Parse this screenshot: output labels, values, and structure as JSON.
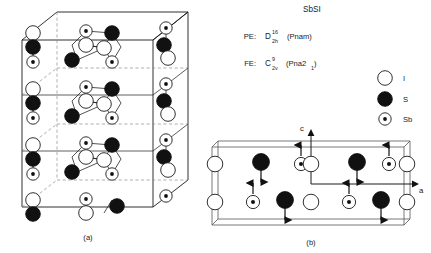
{
  "figure": {
    "compound_title": "SbSI",
    "panel_a_label": "(a)",
    "panel_b_label": "(b)"
  },
  "phases": [
    {
      "abbrev": "PE:",
      "point_group": "D",
      "superscript": "16",
      "subscript": "2h",
      "space_group": "(Pnam)"
    },
    {
      "abbrev": "FE:",
      "point_group": "C",
      "superscript": "9",
      "subscript": "2v",
      "space_group_pre": "(Pna2",
      "space_group_sub": "1",
      "space_group_post": ")"
    }
  ],
  "legend": {
    "items": [
      {
        "symbol": "I",
        "marker": "open-circle"
      },
      {
        "symbol": "S",
        "marker": "filled-circle"
      },
      {
        "symbol": "Sb",
        "marker": "dotted-circle"
      }
    ]
  },
  "axes": {
    "vertical_label": "c",
    "horizontal_label": "a"
  },
  "panel_b": {
    "rows": [
      {
        "row": "top",
        "atoms": [
          {
            "species": "I",
            "x": 0,
            "arrow": "none"
          },
          {
            "species": "S",
            "x": 56,
            "arrow": "down"
          },
          {
            "species": "Sb",
            "x": 104,
            "arrow": "up"
          },
          {
            "species": "I",
            "x": 152,
            "arrow": "none"
          },
          {
            "species": "S",
            "x": 208,
            "arrow": "down"
          },
          {
            "species": "Sb",
            "x": 256,
            "arrow": "up"
          },
          {
            "species": "I",
            "x": 304,
            "arrow": "none"
          }
        ]
      },
      {
        "row": "bottom",
        "atoms": [
          {
            "species": "I",
            "x": 0,
            "arrow": "none"
          },
          {
            "species": "Sb",
            "x": 56,
            "arrow": "up"
          },
          {
            "species": "S",
            "x": 104,
            "arrow": "down"
          },
          {
            "species": "I",
            "x": 152,
            "arrow": "none"
          },
          {
            "species": "Sb",
            "x": 208,
            "arrow": "up"
          },
          {
            "species": "S",
            "x": 256,
            "arrow": "down"
          },
          {
            "species": "I",
            "x": 304,
            "arrow": "none"
          }
        ]
      }
    ]
  },
  "panel_a": {
    "layer_count": 3,
    "description_species": [
      "Sb",
      "S",
      "I"
    ]
  },
  "colors": {
    "ink": "#1a1a1a",
    "atom_fill_dark": "#111111",
    "atom_fill_light": "#ffffff",
    "hidden_line": "#8d8d8d",
    "cell_line": "#555555"
  }
}
